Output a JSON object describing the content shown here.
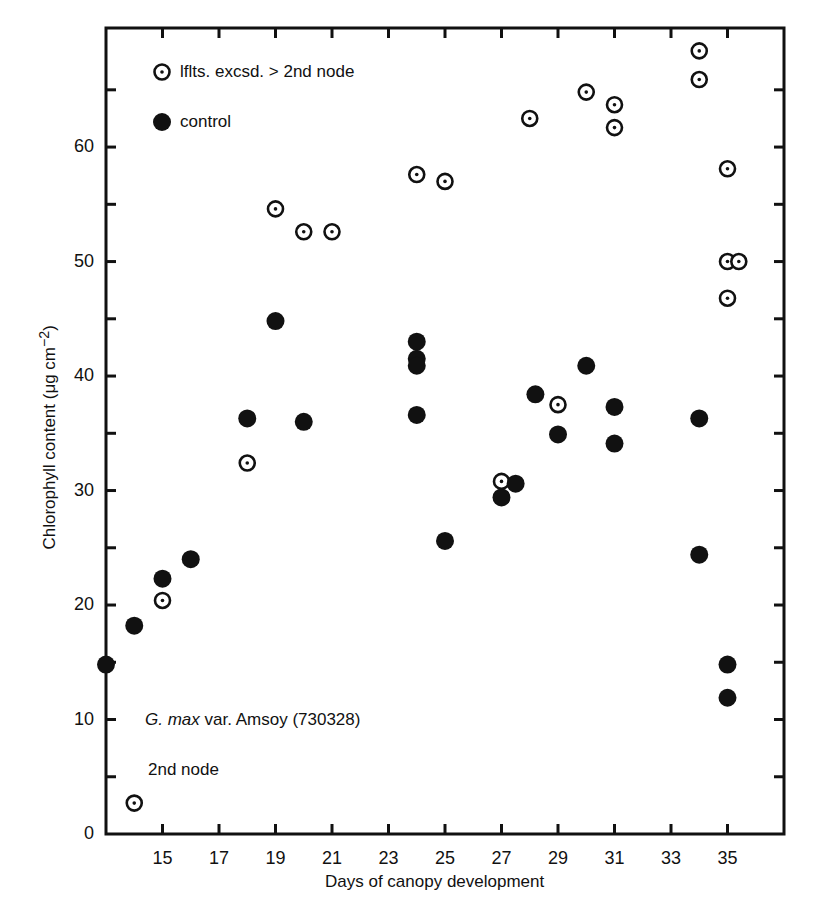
{
  "chart_data": {
    "type": "scatter",
    "title": "",
    "xlabel": "Days of canopy development",
    "ylabel": "Chlorophyll content (μg cm⁻²)",
    "xlim": [
      13,
      37
    ],
    "ylim": [
      0,
      70
    ],
    "x_ticks": [
      15,
      17,
      19,
      21,
      23,
      25,
      27,
      29,
      31,
      33,
      35
    ],
    "y_ticks": [
      0,
      10,
      20,
      30,
      40,
      50,
      60
    ],
    "y_minor_ticks": [
      5,
      15,
      25,
      35,
      45,
      55,
      65
    ],
    "grid": false,
    "legend_position": "upper-left-inside",
    "annotations": [
      "G. max var. Amsoy (730328)",
      "2nd node"
    ],
    "series": [
      {
        "name": "lflts. excsd. > 2nd node",
        "marker": "circle-dot-open",
        "points": [
          [
            14,
            2.7
          ],
          [
            15,
            20.4
          ],
          [
            18,
            32.4
          ],
          [
            19,
            54.6
          ],
          [
            20,
            52.6
          ],
          [
            21,
            52.6
          ],
          [
            24,
            57.6
          ],
          [
            25,
            57.0
          ],
          [
            27,
            30.8
          ],
          [
            28,
            62.5
          ],
          [
            29,
            37.5
          ],
          [
            30,
            64.8
          ],
          [
            31,
            63.7
          ],
          [
            31,
            61.7
          ],
          [
            34,
            68.4
          ],
          [
            34,
            65.9
          ],
          [
            35,
            58.1
          ],
          [
            35,
            50.0
          ],
          [
            35.4,
            50.0
          ],
          [
            35,
            46.8
          ]
        ]
      },
      {
        "name": "control",
        "marker": "circle-filled",
        "points": [
          [
            13,
            14.8
          ],
          [
            14,
            18.2
          ],
          [
            15,
            22.3
          ],
          [
            16,
            24.0
          ],
          [
            18,
            36.3
          ],
          [
            19,
            44.8
          ],
          [
            20,
            36.0
          ],
          [
            24,
            43.0
          ],
          [
            24,
            41.5
          ],
          [
            24,
            40.9
          ],
          [
            24,
            36.6
          ],
          [
            25,
            25.6
          ],
          [
            27,
            29.4
          ],
          [
            27.5,
            30.6
          ],
          [
            28.2,
            38.4
          ],
          [
            29,
            34.9
          ],
          [
            30,
            40.9
          ],
          [
            31,
            37.3
          ],
          [
            31,
            34.1
          ],
          [
            34,
            36.3
          ],
          [
            34,
            24.4
          ],
          [
            35,
            14.8
          ],
          [
            35,
            11.9
          ]
        ]
      }
    ]
  },
  "legend": {
    "open_label": "lflts. excsd. > 2nd node",
    "filled_label": "control"
  },
  "annotation": {
    "species_italic": "G. max",
    "species_rest": " var. Amsoy (730328)",
    "node": "2nd node"
  },
  "axes": {
    "xlabel": "Days of canopy development",
    "ylabel_main": "Chlorophyll content (μg cm",
    "ylabel_sup": "−2",
    "ylabel_end": ")"
  }
}
